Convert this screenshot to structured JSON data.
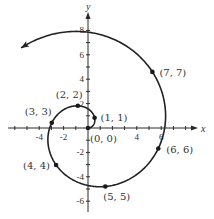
{
  "chart_data": {
    "type": "line",
    "title": "",
    "xlabel": "x",
    "ylabel": "y",
    "xlim": [
      -6.5,
      9
    ],
    "ylim": [
      -7,
      9.5
    ],
    "grid": false,
    "x_ticks": [
      -4,
      -2,
      4,
      6
    ],
    "y_ticks": [
      8,
      6,
      4,
      2,
      -2,
      -4,
      -6
    ],
    "x_tick_labels": [
      "-4",
      "-2",
      "4",
      "6"
    ],
    "y_tick_labels": [
      "8",
      "6",
      "4",
      "2",
      "-2",
      "-4",
      "-6"
    ],
    "curve": {
      "equation": "r = θ",
      "theta_start": 0,
      "theta_end": 8.55,
      "arrow_at_end": true
    },
    "points": [
      {
        "label": "(0, 0)",
        "r": 0,
        "theta": 0
      },
      {
        "label": "(1, 1)",
        "r": 1,
        "theta": 1
      },
      {
        "label": "(2, 2)",
        "r": 2,
        "theta": 2
      },
      {
        "label": "(3, 3)",
        "r": 3,
        "theta": 3
      },
      {
        "label": "(4, 4)",
        "r": 4,
        "theta": 4
      },
      {
        "label": "(5, 5)",
        "r": 5,
        "theta": 5
      },
      {
        "label": "(6, 6)",
        "r": 6,
        "theta": 6
      },
      {
        "label": "(7, 7)",
        "r": 7,
        "theta": 7
      }
    ]
  },
  "layout": {
    "origin_px": [
      88,
      128
    ],
    "px_per_unit": 12.2,
    "label_offsets": [
      [
        2,
        14
      ],
      [
        6,
        3
      ],
      [
        -22,
        -8
      ],
      [
        -27,
        -8
      ],
      [
        -33,
        4
      ],
      [
        -2,
        14
      ],
      [
        8,
        5
      ],
      [
        7,
        4
      ]
    ]
  }
}
